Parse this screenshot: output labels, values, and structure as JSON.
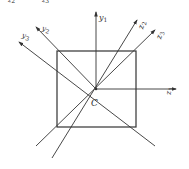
{
  "figure": {
    "center_label": "C",
    "axes": [
      {
        "name": "y",
        "sub": "1"
      },
      {
        "name": "z",
        "sub": "1"
      },
      {
        "name": "z",
        "sub": "2"
      },
      {
        "name": "z",
        "sub": "3"
      },
      {
        "name": "y",
        "sub": "2"
      },
      {
        "name": "y",
        "sub": "3"
      }
    ],
    "top_cut_labels": [
      {
        "name": "z",
        "sub": "2"
      },
      {
        "name": "z",
        "sub": "3"
      }
    ],
    "stroke_color": "#333333"
  }
}
